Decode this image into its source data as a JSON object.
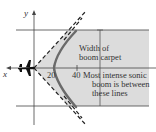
{
  "figure": {
    "axes": {
      "x_label": "x",
      "y_label": "y"
    },
    "ticks": {
      "t20": "20",
      "t40": "40"
    },
    "annotations": {
      "width_line1": "Width of",
      "width_line2": "boom carpet",
      "intense_line1": "Most intense sonic",
      "intense_line2": "boom is between",
      "intense_line3": "these lines"
    },
    "colors": {
      "shade": "#d9d9d9",
      "line": "#333333",
      "curve": "#6e6e6e"
    },
    "icons": {
      "aircraft": "jet-airplane-silhouette"
    }
  }
}
